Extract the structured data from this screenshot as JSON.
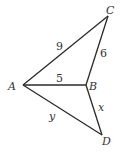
{
  "diagram": {
    "points": {
      "A": {
        "label": "A",
        "x": 23,
        "y": 85
      },
      "B": {
        "label": "B",
        "x": 86,
        "y": 85
      },
      "C": {
        "label": "C",
        "x": 108,
        "y": 16
      },
      "D": {
        "label": "D",
        "x": 102,
        "y": 135
      }
    },
    "segments": [
      {
        "from": "A",
        "to": "C",
        "label": "9"
      },
      {
        "from": "B",
        "to": "C",
        "label": "6"
      },
      {
        "from": "A",
        "to": "B",
        "label": "5"
      },
      {
        "from": "B",
        "to": "D",
        "label": "x"
      },
      {
        "from": "A",
        "to": "D",
        "label": "y"
      }
    ],
    "colors": {
      "stroke": "#2a2a2a",
      "text": "#333333",
      "background": "#ffffff"
    }
  }
}
